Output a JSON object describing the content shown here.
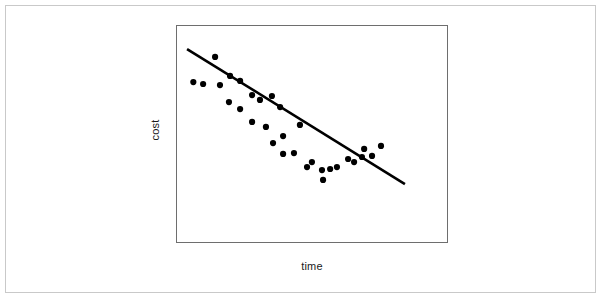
{
  "figure": {
    "background_color": "#ffffff",
    "outer_border_color": "#c9c9c9",
    "plot_border_color": "#6e6e6e"
  },
  "axes": {
    "xlabel": "time",
    "ylabel": "cost"
  },
  "chart_data": {
    "type": "scatter",
    "title": "",
    "subtitle": "",
    "xlabel": "time",
    "ylabel": "cost",
    "xlim": [
      0,
      100
    ],
    "ylim": [
      0,
      100
    ],
    "xticks": [],
    "yticks": [],
    "xticklabels": [],
    "yticklabels": [],
    "grid": false,
    "legend": false,
    "marker_color": "#000000",
    "marker_size_px": 4,
    "series": [
      {
        "name": "observations",
        "type": "scatter",
        "marker_color": "#000000",
        "x": [
          14.0,
          6.0,
          9.6,
          15.8,
          19.5,
          23.2,
          19.1,
          23.2,
          27.6,
          30.5,
          34.9,
          37.9,
          27.6,
          32.7,
          35.3,
          39.0,
          39.0,
          43.0,
          45.2,
          47.8,
          49.6,
          53.3,
          53.7,
          56.3,
          58.8,
          62.9,
          65.1,
          68.0,
          68.8,
          71.7,
          75.0
        ],
        "y": [
          85.8,
          74.3,
          73.4,
          72.9,
          77.1,
          74.8,
          65.1,
          61.9,
          68.3,
          66.1,
          67.9,
          62.8,
          56.0,
          53.7,
          46.3,
          49.5,
          41.3,
          41.7,
          54.6,
          35.3,
          37.6,
          33.9,
          29.4,
          34.4,
          35.3,
          39.0,
          37.6,
          39.9,
          43.6,
          40.4,
          45.0
        ]
      },
      {
        "name": "trend-line",
        "type": "line",
        "line_color": "#000000",
        "line_width_px": 2.6,
        "x": [
          3.7,
          83.8
        ],
        "y": [
          89.4,
          27.5
        ]
      }
    ]
  }
}
